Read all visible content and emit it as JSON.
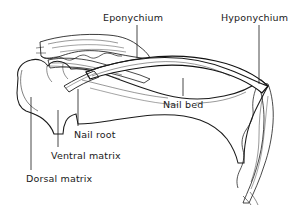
{
  "figure": {
    "background_color": "#ffffff",
    "ink_color": "#1a1a1a",
    "stipple_color": "#5a5a5a",
    "nail_plate_color": "#ffffff",
    "width": 305,
    "height": 205
  },
  "labels": [
    {
      "id": "eponychium",
      "text": "Eponychium",
      "x": 103,
      "y": 12,
      "leader": {
        "x1": 137,
        "y1": 25,
        "x2": 137,
        "y2": 58
      }
    },
    {
      "id": "hyponychium",
      "text": "Hyponychium",
      "x": 221,
      "y": 12,
      "leader": {
        "x1": 259,
        "y1": 25,
        "x2": 259,
        "y2": 84
      }
    },
    {
      "id": "nail-bed",
      "text": "Nail bed",
      "x": 163,
      "y": 99,
      "leader": {
        "x1": 183,
        "y1": 78,
        "x2": 183,
        "y2": 96
      }
    },
    {
      "id": "nail-root",
      "text": "Nail root",
      "x": 74,
      "y": 129,
      "leader": {
        "x1": 78,
        "y1": 89,
        "x2": 78,
        "y2": 126
      }
    },
    {
      "id": "ventral-matrix",
      "text": "Ventral matrix",
      "x": 51,
      "y": 150,
      "leader": {
        "x1": 58,
        "y1": 110,
        "x2": 58,
        "y2": 147
      }
    },
    {
      "id": "dorsal-matrix",
      "text": "Dorsal matrix",
      "x": 26,
      "y": 173,
      "leader": {
        "x1": 31,
        "y1": 97,
        "x2": 31,
        "y2": 170
      }
    }
  ]
}
